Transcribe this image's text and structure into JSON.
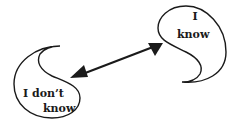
{
  "diagram": {
    "nodes": [
      {
        "id": "know",
        "line1": "I",
        "line2": "know"
      },
      {
        "id": "dont-know",
        "line1": "I don’t",
        "line2": "know"
      }
    ],
    "edges": [
      {
        "from": "dont-know",
        "to": "know",
        "type": "bidirectional-arrow"
      }
    ]
  },
  "colors": {
    "stroke": "#1a1a1a",
    "background": "#ffffff"
  }
}
